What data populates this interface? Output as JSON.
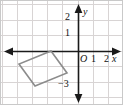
{
  "figure": {
    "kind": "coordinate-plane-diagram",
    "width": 123,
    "height": 105,
    "background": "#ffffff",
    "border_color": "#c9c9c9"
  },
  "colors": {
    "grid": "#d8d4d4",
    "axis": "#1a1a1a",
    "shape_stroke": "#8c8c8c",
    "text": "#111111"
  },
  "grid": {
    "visible": true,
    "spacing_px": 15.6,
    "x_lines_px": [
      1,
      16,
      31,
      46,
      62,
      77,
      93,
      108,
      122
    ],
    "y_lines_px": [
      4,
      19,
      35,
      50,
      66,
      81,
      97
    ]
  },
  "axes": {
    "origin_px": {
      "x": 77,
      "y": 50
    },
    "unit_px": 15.6,
    "x_axis": {
      "name": "x",
      "name_pos_px": {
        "x": 112,
        "y": 52
      },
      "arrow_left": true,
      "arrow_right": true,
      "start_px": {
        "x": 6,
        "y": 50
      },
      "end_px": {
        "x": 117,
        "y": 50
      },
      "ticks": [
        {
          "label": "1",
          "value": 1,
          "x_px": 93,
          "y_px": 57
        },
        {
          "label": "2",
          "value": 2,
          "x_px": 106,
          "y_px": 57
        }
      ]
    },
    "y_axis": {
      "name": "y",
      "name_pos_px": {
        "x": 82,
        "y": 8
      },
      "arrow_up": true,
      "arrow_down": true,
      "start_px": {
        "x": 77,
        "y": 6
      },
      "end_px": {
        "x": 77,
        "y": 100
      },
      "ticks": [
        {
          "label": "2",
          "value": 2,
          "x_px": 66,
          "y_px": 15
        },
        {
          "label": "1",
          "value": 1,
          "x_px": 66,
          "y_px": 31
        },
        {
          "label": "−3",
          "value": -3,
          "x_px": 60,
          "y_px": 83
        }
      ]
    },
    "origin_label": {
      "text": "O",
      "x_px": 79,
      "y_px": 52
    }
  },
  "shapes": [
    {
      "name": "tilted-square",
      "type": "polygon",
      "stroke": "#8c8c8c",
      "stroke_width": 1.6,
      "fill": "none",
      "vertices_px": [
        {
          "x": 50,
          "y": 50
        },
        {
          "x": 66,
          "y": 72
        },
        {
          "x": 34,
          "y": 85
        },
        {
          "x": 18,
          "y": 63
        }
      ],
      "vertices_graph": [
        {
          "x": -1.7,
          "y": 0
        },
        {
          "x": -0.7,
          "y": -1.4
        },
        {
          "x": -2.8,
          "y": -2.25
        },
        {
          "x": -3.8,
          "y": -0.85
        }
      ]
    }
  ]
}
